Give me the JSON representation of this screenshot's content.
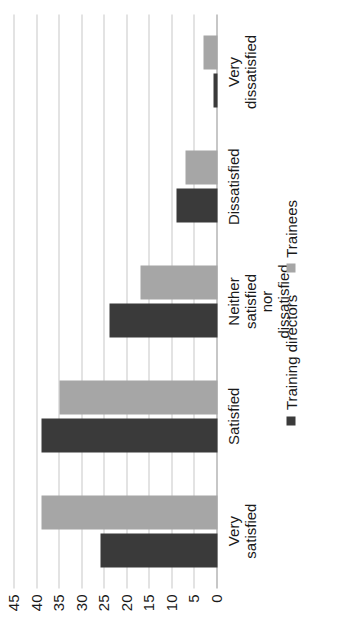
{
  "chart_data": {
    "type": "bar",
    "title": "",
    "subtitle": "",
    "xlabel": "",
    "ylabel": "",
    "orientation": "rotated-90",
    "grid": true,
    "legend_position": "bottom",
    "ylim": [
      0,
      45
    ],
    "ytick_step": 5,
    "yticks": [
      "0",
      "5",
      "10",
      "15",
      "20",
      "25",
      "30",
      "35",
      "40",
      "45"
    ],
    "categories": [
      "Very satisfied",
      "Satisfied",
      "Neither satisfied\nnor dissatisfied",
      "Dissatisfied",
      "Very dissatisfied"
    ],
    "series": [
      {
        "name": "Training directors",
        "color": "#3a3a3a",
        "values": [
          26,
          39,
          24,
          9,
          1
        ]
      },
      {
        "name": "Trainees",
        "color": "#a6a6a6",
        "values": [
          39,
          35,
          17,
          7,
          3
        ]
      }
    ]
  },
  "legend": {
    "items": [
      {
        "label": "Training directors",
        "color": "#3a3a3a"
      },
      {
        "label": "Trainees",
        "color": "#a6a6a6"
      }
    ]
  },
  "colors": {
    "series_training_directors": "#3a3a3a",
    "series_trainees": "#a6a6a6",
    "gridline": "#c8c8c8",
    "axis": "#8f8f8f",
    "background": "#ffffff",
    "text": "#1a1a1a"
  }
}
